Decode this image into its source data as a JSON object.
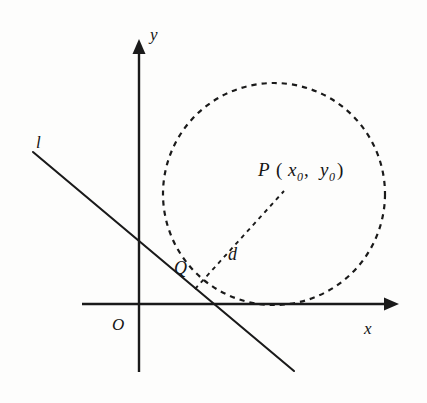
{
  "figure": {
    "kind": "coordinate-geometry-diagram",
    "background_color": "#fdfdfc",
    "ink_color": "#1a1a1a"
  },
  "axes": {
    "origin_label": "O",
    "x_axis_label": "x",
    "y_axis_label": "y",
    "origin_px": {
      "x": 139,
      "y": 304
    },
    "x_axis": {
      "x1": 82,
      "y1": 304,
      "x2": 396,
      "y2": 304
    },
    "y_axis": {
      "x1": 139,
      "y1": 372,
      "x2": 139,
      "y2": 42
    }
  },
  "line": {
    "label": "l",
    "label_px": {
      "x": 38,
      "y": 146
    },
    "start_px": {
      "x": 33,
      "y": 152
    },
    "end_px": {
      "x": 294,
      "y": 371
    }
  },
  "circle": {
    "center_px": {
      "x": 274,
      "y": 194
    },
    "radius_px": 111,
    "style": "dashed"
  },
  "point_p": {
    "label_main": "P",
    "open_paren": "(",
    "var_x": "x",
    "sub_x": "0",
    "comma": ",",
    "var_y": "y",
    "sub_y": "0",
    "close_paren": ")",
    "full_label": "P (x0, y0)",
    "label_px": {
      "x": 258,
      "y": 174
    },
    "point_px": {
      "x": 286,
      "y": 189
    }
  },
  "point_q": {
    "label": "Q",
    "label_px": {
      "x": 180,
      "y": 272
    },
    "point_px": {
      "x": 195,
      "y": 289
    }
  },
  "distance_segment": {
    "label": "d",
    "label_px": {
      "x": 232,
      "y": 255
    },
    "from_px": {
      "x": 195,
      "y": 289
    },
    "to_px": {
      "x": 284,
      "y": 191
    },
    "style": "dashed"
  }
}
